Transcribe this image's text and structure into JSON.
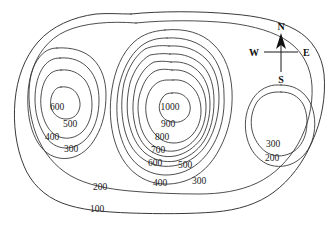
{
  "figure": {
    "background_color": "#ffffff",
    "line_color": "#3a3a3a",
    "label_color": "#1a1a1a"
  },
  "chart_data": {
    "type": "contour-map",
    "units": "meters",
    "contour_interval": 100,
    "elevation_levels": [
      100,
      200,
      300,
      400,
      500,
      600,
      700,
      800,
      900,
      1000
    ],
    "peaks": [
      {
        "name": "west-hill",
        "summit_elevation": 600,
        "center": [
          58,
          103
        ],
        "closed_contours": [
          600,
          500,
          400,
          300
        ]
      },
      {
        "name": "central-hill",
        "summit_elevation": 1000,
        "center": [
          172,
          103
        ],
        "closed_contours": [
          1000,
          900,
          800,
          700,
          600,
          500,
          400,
          300
        ]
      },
      {
        "name": "east-hill",
        "summit_elevation": 300,
        "center": [
          281,
          118
        ],
        "closed_contours": [
          300,
          200
        ]
      }
    ],
    "labels": [
      {
        "text": "600",
        "elevation": 600,
        "x": 57,
        "y": 110,
        "hill": "west-hill"
      },
      {
        "text": "500",
        "elevation": 500,
        "x": 70,
        "y": 127,
        "hill": "west-hill"
      },
      {
        "text": "400",
        "elevation": 400,
        "x": 52,
        "y": 140,
        "hill": "west-hill"
      },
      {
        "text": "300",
        "elevation": 300,
        "x": 71,
        "y": 152,
        "hill": "west-hill"
      },
      {
        "text": "1000",
        "elevation": 1000,
        "x": 170,
        "y": 110,
        "hill": "central-hill"
      },
      {
        "text": "900",
        "elevation": 900,
        "x": 168,
        "y": 127,
        "hill": "central-hill"
      },
      {
        "text": "800",
        "elevation": 800,
        "x": 162,
        "y": 140,
        "hill": "central-hill"
      },
      {
        "text": "700",
        "elevation": 700,
        "x": 158,
        "y": 153,
        "hill": "central-hill"
      },
      {
        "text": "600",
        "elevation": 600,
        "x": 155,
        "y": 166,
        "hill": "central-hill"
      },
      {
        "text": "500",
        "elevation": 500,
        "x": 185,
        "y": 168,
        "hill": "central-hill"
      },
      {
        "text": "400",
        "elevation": 400,
        "x": 160,
        "y": 186,
        "hill": "central-hill"
      },
      {
        "text": "300",
        "elevation": 300,
        "x": 199,
        "y": 184,
        "hill": "central-hill"
      },
      {
        "text": "300",
        "elevation": 300,
        "x": 273,
        "y": 147,
        "hill": "east-hill"
      },
      {
        "text": "200",
        "elevation": 200,
        "x": 272,
        "y": 161,
        "hill": "east-hill"
      },
      {
        "text": "200",
        "elevation": 200,
        "x": 100,
        "y": 190,
        "hill": "outer"
      },
      {
        "text": "100",
        "elevation": 100,
        "x": 97,
        "y": 212,
        "hill": "outer"
      }
    ]
  },
  "compass": {
    "name": "compass-rose",
    "north": "N",
    "east": "E",
    "south": "S",
    "west": "W",
    "center": [
      281,
      52
    ]
  }
}
